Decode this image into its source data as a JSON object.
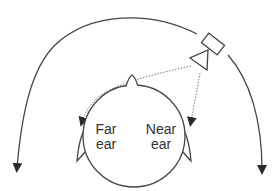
{
  "diagram": {
    "labels": {
      "far_ear": [
        "Far",
        "ear"
      ],
      "near_ear": [
        "Near",
        "ear"
      ]
    },
    "colors": {
      "stroke": "#444444",
      "dotted": "#777777",
      "background": "#ffffff"
    },
    "elements": [
      "head",
      "nose",
      "far-ear",
      "near-ear",
      "loudspeaker",
      "direct-path-to-far-ear",
      "direct-path-to-near-ear",
      "outer-arc-left",
      "outer-arc-right"
    ]
  }
}
